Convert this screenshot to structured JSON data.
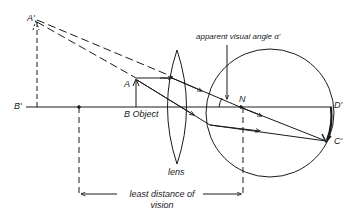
{
  "diagram": {
    "type": "optics-magnifier-ray-diagram",
    "colors": {
      "line": "#1a1a1a",
      "background": "#ffffff"
    },
    "labels": {
      "A_prime": "A'",
      "B_prime": "B'",
      "A": "A",
      "B_object": "B Object",
      "apparent_angle": "apparent visual angle α'",
      "N": "N",
      "D_prime": "D'",
      "C_prime": "C'",
      "lens": "lens",
      "least_distance_line1": "least distance of",
      "least_distance_line2": "vision"
    },
    "elements": [
      "virtual image A'B' (dashed)",
      "object AB (arrow)",
      "convex lens",
      "eye (circle) with nodal point N",
      "retinal image D'C'",
      "dimension: least distance of vision"
    ]
  }
}
